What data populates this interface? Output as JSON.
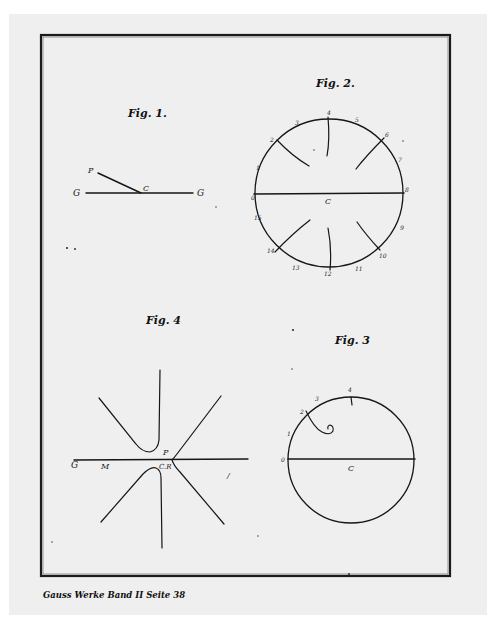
{
  "page": {
    "background": "#efefef",
    "ink_color": "#161616",
    "footer_caption": "Gauss Werke Band II Seite 38"
  },
  "figures": {
    "fig1": {
      "title": "Fig. 1.",
      "labels": {
        "left": "G",
        "right": "G",
        "end": "P",
        "center": "C"
      }
    },
    "fig2": {
      "title": "Fig. 2.",
      "center": "C",
      "rim_labels": [
        "0",
        "1",
        "2",
        "3",
        "4",
        "5",
        "6",
        "7",
        "8",
        "9",
        "10",
        "11",
        "12",
        "13",
        "14",
        "15",
        "16"
      ]
    },
    "fig3": {
      "title": "Fig. 3",
      "center": "C",
      "rim_labels": [
        "0",
        "1",
        "2",
        "3",
        "4"
      ]
    },
    "fig4": {
      "title": "Fig. 4",
      "labels": {
        "left": "G",
        "m": "M",
        "p": "P",
        "center": "C.R",
        "right_mark": "/"
      }
    }
  }
}
